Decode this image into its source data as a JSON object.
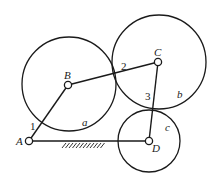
{
  "diagram": {
    "type": "four-bar linkage with rolling circles",
    "joints": [
      {
        "id": "A",
        "label": "A",
        "x": 29,
        "y": 141
      },
      {
        "id": "B",
        "label": "B",
        "x": 68,
        "y": 85
      },
      {
        "id": "C",
        "label": "C",
        "x": 158,
        "y": 62
      },
      {
        "id": "D",
        "label": "D",
        "x": 149,
        "y": 141
      }
    ],
    "links": [
      {
        "from": "A",
        "to": "B",
        "label": "1"
      },
      {
        "from": "B",
        "to": "C",
        "label": "2"
      },
      {
        "from": "C",
        "to": "D",
        "label": "3"
      },
      {
        "from": "A",
        "to": "D",
        "label": "",
        "ground": true
      }
    ],
    "circles": [
      {
        "id": "a",
        "label": "a",
        "cx": 69,
        "cy": 84,
        "r": 47
      },
      {
        "id": "b",
        "label": "b",
        "cx": 159,
        "cy": 62,
        "r": 47
      },
      {
        "id": "c",
        "label": "c",
        "cx": 149,
        "cy": 141,
        "r": 31
      }
    ],
    "labels": {
      "A": "A",
      "B": "B",
      "C": "C",
      "D": "D",
      "link1": "1",
      "link2": "2",
      "link3": "3",
      "circle_a": "a",
      "circle_b": "b",
      "circle_c": "c"
    },
    "colors": {
      "stroke": "#1a1a1a",
      "background": "#ffffff"
    }
  }
}
